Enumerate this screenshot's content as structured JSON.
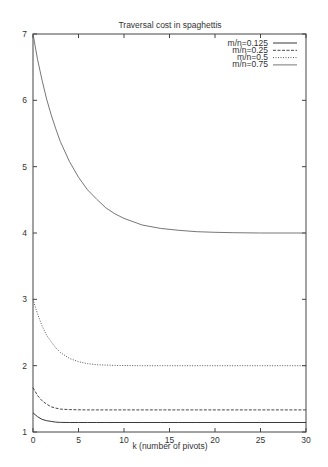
{
  "chart_data": {
    "type": "line",
    "title": "Traversal cost in spaghettis",
    "xlabel": "k (number of pivots)",
    "ylabel": "",
    "xlim": [
      0,
      30
    ],
    "ylim": [
      1,
      7
    ],
    "xticks": [
      0,
      5,
      10,
      15,
      20,
      25,
      30
    ],
    "yticks": [
      1,
      2,
      3,
      4,
      5,
      6,
      7
    ],
    "grid": false,
    "legend_position": "top-right",
    "x": [
      0,
      0.5,
      1,
      1.5,
      2,
      2.5,
      3,
      4,
      5,
      6,
      7,
      8,
      9,
      10,
      12,
      14,
      16,
      18,
      20,
      22,
      25,
      30
    ],
    "series": [
      {
        "name": "m/n=0.125",
        "style": "solid",
        "values": [
          1.29,
          1.23,
          1.19,
          1.17,
          1.16,
          1.15,
          1.145,
          1.143,
          1.143,
          1.143,
          1.143,
          1.143,
          1.143,
          1.143,
          1.143,
          1.143,
          1.143,
          1.143,
          1.143,
          1.143,
          1.143,
          1.143
        ]
      },
      {
        "name": "m/n=0.25",
        "style": "dashed",
        "values": [
          1.67,
          1.55,
          1.47,
          1.42,
          1.38,
          1.36,
          1.345,
          1.337,
          1.334,
          1.333,
          1.333,
          1.333,
          1.333,
          1.333,
          1.333,
          1.333,
          1.333,
          1.333,
          1.333,
          1.333,
          1.333,
          1.333
        ]
      },
      {
        "name": "m/n=0.5",
        "style": "dotted",
        "values": [
          3.0,
          2.78,
          2.6,
          2.46,
          2.36,
          2.27,
          2.2,
          2.11,
          2.06,
          2.03,
          2.015,
          2.008,
          2.004,
          2.002,
          2.0,
          2.0,
          2.0,
          2.0,
          2.0,
          2.0,
          2.0,
          2.0
        ]
      },
      {
        "name": "m/n=0.75",
        "style": "dash-dot",
        "values": [
          7.0,
          6.62,
          6.3,
          6.02,
          5.78,
          5.57,
          5.38,
          5.08,
          4.84,
          4.65,
          4.51,
          4.38,
          4.29,
          4.22,
          4.12,
          4.07,
          4.04,
          4.02,
          4.01,
          4.005,
          4.0,
          4.0
        ]
      }
    ]
  },
  "chart": {
    "title": "Traversal cost in spaghettis",
    "xlabel": "k (number of pivots)",
    "legend": [
      "m/n=0.125",
      "m/n=0.25",
      "m/n=0.5",
      "m/n=0.75"
    ]
  }
}
